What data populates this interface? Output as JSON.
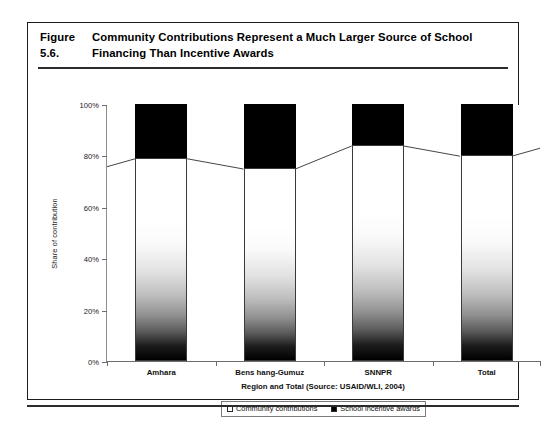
{
  "figure": {
    "number": "Figure 5.6.",
    "title_line1": "Community Contributions Represent a Much Larger Source of School",
    "title_line2": "Financing Than Incentive Awards"
  },
  "legend": {
    "items": [
      {
        "label": "Community contributions",
        "swatch_icon": "white-square-swatch",
        "color": "#ffffff"
      },
      {
        "label": "School incentive awards",
        "swatch_icon": "black-square-swatch",
        "color": "#000000"
      }
    ]
  },
  "chart_data": {
    "type": "bar",
    "stacked": true,
    "percent_stacked": true,
    "title": "Community Contributions Represent a Much Larger Source of School Financing Than Incentive Awards",
    "subtitle": "",
    "xlabel": "Region and Total (Source: USAID/WLI, 2004)",
    "ylabel": "Share of contribution",
    "categories": [
      "Amhara",
      "Bens hang-Gumuz",
      "SNNPR",
      "Total"
    ],
    "series": [
      {
        "name": "Community contributions",
        "color": "#ffffff",
        "values": [
          79,
          75,
          84,
          80
        ]
      },
      {
        "name": "School incentive awards",
        "color": "#000000",
        "values": [
          21,
          25,
          16,
          20
        ]
      }
    ],
    "ylim": [
      0,
      100
    ],
    "yticks": [
      0,
      20,
      40,
      60,
      80,
      100
    ],
    "ytick_labels": [
      "0%",
      "20%",
      "40%",
      "60%",
      "80%",
      "100%"
    ],
    "grid": false,
    "series_lines": true,
    "legend_position": "bottom"
  }
}
